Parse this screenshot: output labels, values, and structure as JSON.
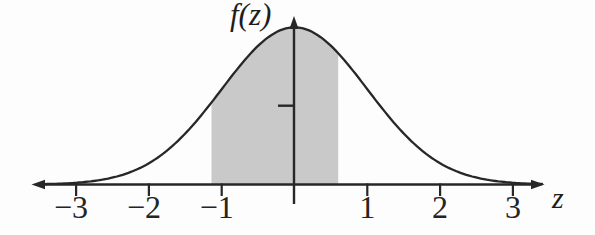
{
  "colors": {
    "ink": "#272727",
    "shade": "#c9c9c9",
    "background": "#fdfdfd"
  },
  "chart_data": {
    "type": "area",
    "title": "",
    "xlabel": "z",
    "ylabel": "f(z)",
    "xlim": [
      -3.6,
      3.45
    ],
    "ylim": [
      0,
      0.43
    ],
    "grid": false,
    "x_ticks": [
      -3,
      -2,
      -1,
      1,
      2,
      3
    ],
    "x_tick_labels": [
      "−3",
      "−2",
      "−1",
      "1",
      "2",
      "3"
    ],
    "y_ticks": [
      0.2
    ],
    "y_tick_labels": [
      ""
    ],
    "curve": {
      "kind": "normal_pdf",
      "mean": 0,
      "sd": 1,
      "peak_value": 0.3989
    },
    "shaded_region": {
      "z_from": -1.14,
      "z_to": 0.6
    },
    "points": [
      {
        "z": -3.0,
        "f": 0.0044
      },
      {
        "z": -2.5,
        "f": 0.0175
      },
      {
        "z": -2.0,
        "f": 0.054
      },
      {
        "z": -1.5,
        "f": 0.1295
      },
      {
        "z": -1.0,
        "f": 0.242
      },
      {
        "z": -0.5,
        "f": 0.3521
      },
      {
        "z": 0.0,
        "f": 0.3989
      },
      {
        "z": 0.5,
        "f": 0.3521
      },
      {
        "z": 1.0,
        "f": 0.242
      },
      {
        "z": 1.5,
        "f": 0.1295
      },
      {
        "z": 2.0,
        "f": 0.054
      },
      {
        "z": 2.5,
        "f": 0.0175
      },
      {
        "z": 3.0,
        "f": 0.0044
      }
    ]
  }
}
